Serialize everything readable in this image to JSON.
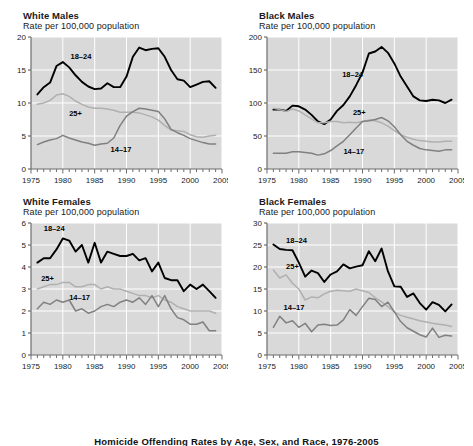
{
  "figure": {
    "caption": "Homicide Offending Rates by Age, Sex, and Race, 1976-2005"
  },
  "colors": {
    "plot_background": "#d9d9d9",
    "gridline": "#ffffff",
    "axis": "#6d6d6d",
    "series_18_24": "#000000",
    "series_25plus": "#b0b0b0",
    "series_14_17": "#808080",
    "text": "#1a1a1a"
  },
  "panels": [
    {
      "title": "White Males",
      "subtitle": "Rate per 100,000 population",
      "labels": {
        "a": "18–24",
        "b": "25+",
        "c": "14–17"
      }
    },
    {
      "title": "Black Males",
      "subtitle": "Rate per 100,000 population",
      "labels": {
        "a": "18–24",
        "b": "25+",
        "c": "14–17"
      }
    },
    {
      "title": "White Females",
      "subtitle": "Rate per 100,000 population",
      "labels": {
        "a": "18–24",
        "b": "25+",
        "c": "14–17"
      }
    },
    {
      "title": "Black Females",
      "subtitle": "Rate per 100,000 population",
      "labels": {
        "a": "18–24",
        "b": "25+",
        "c": "14–17"
      }
    }
  ],
  "chart_data": [
    {
      "type": "line",
      "title": "White Males",
      "subtitle": "Rate per 100,000 population",
      "xlabel": "",
      "ylabel": "Rate per 100,000 population",
      "xlim": [
        1975,
        2005
      ],
      "ylim": [
        0,
        20
      ],
      "yticks": [
        0,
        5,
        10,
        15,
        20
      ],
      "xticks": [
        1975,
        1980,
        1985,
        1990,
        1995,
        2000,
        2005
      ],
      "xtick_minor_step": 1,
      "grid": true,
      "legend": "inline-annotations",
      "x": [
        1976,
        1977,
        1978,
        1979,
        1980,
        1981,
        1982,
        1983,
        1984,
        1985,
        1986,
        1987,
        1988,
        1989,
        1990,
        1991,
        1992,
        1993,
        1994,
        1995,
        1996,
        1997,
        1998,
        1999,
        2000,
        2001,
        2002,
        2003,
        2004
      ],
      "series": [
        {
          "name": "18–24",
          "values": [
            11.3,
            12.4,
            13.1,
            15.6,
            16.2,
            15.4,
            14.2,
            13.2,
            12.5,
            12.1,
            12.2,
            13.0,
            12.4,
            12.4,
            14.0,
            17.0,
            18.4,
            18.0,
            18.2,
            18.3,
            17.0,
            15.0,
            13.6,
            13.4,
            12.4,
            12.8,
            13.2,
            13.3,
            12.3
          ]
        },
        {
          "name": "25+",
          "values": [
            9.8,
            10.0,
            10.4,
            11.2,
            11.4,
            11.0,
            10.3,
            9.8,
            9.4,
            9.2,
            9.2,
            9.1,
            8.9,
            8.6,
            8.6,
            8.6,
            8.5,
            8.2,
            7.9,
            7.4,
            6.6,
            5.9,
            5.8,
            5.7,
            5.2,
            4.9,
            4.8,
            5.0,
            5.1
          ]
        },
        {
          "name": "14–17",
          "values": [
            3.7,
            4.1,
            4.4,
            4.6,
            5.1,
            4.7,
            4.4,
            4.1,
            3.9,
            3.6,
            3.8,
            3.9,
            4.7,
            6.6,
            8.0,
            8.7,
            9.2,
            9.1,
            8.9,
            8.7,
            7.6,
            6.0,
            5.5,
            5.1,
            4.6,
            4.3,
            4.0,
            3.8,
            3.8
          ]
        }
      ]
    },
    {
      "type": "line",
      "title": "Black Males",
      "subtitle": "Rate per 100,000 population",
      "xlabel": "",
      "ylabel": "Rate per 100,000 population",
      "xlim": [
        1975,
        2005
      ],
      "ylim": [
        0,
        200
      ],
      "yticks": [
        0,
        50,
        100,
        150,
        200
      ],
      "xticks": [
        1975,
        1980,
        1985,
        1990,
        1995,
        2000,
        2005
      ],
      "xtick_minor_step": 1,
      "grid": true,
      "legend": "inline-annotations",
      "x": [
        1976,
        1977,
        1978,
        1979,
        1980,
        1981,
        1982,
        1983,
        1984,
        1985,
        1986,
        1987,
        1988,
        1989,
        1990,
        1991,
        1992,
        1993,
        1994,
        1995,
        1996,
        1997,
        1998,
        1999,
        2000,
        2001,
        2002,
        2003,
        2004
      ],
      "series": [
        {
          "name": "18–24",
          "values": [
            90,
            90,
            88,
            96,
            95,
            90,
            82,
            72,
            68,
            75,
            88,
            97,
            110,
            127,
            146,
            175,
            178,
            185,
            176,
            160,
            140,
            125,
            110,
            104,
            103,
            105,
            104,
            100,
            105
          ]
        },
        {
          "name": "25+",
          "values": [
            92,
            90,
            87,
            91,
            88,
            82,
            76,
            70,
            70,
            72,
            72,
            70,
            71,
            70,
            72,
            74,
            73,
            70,
            65,
            58,
            52,
            48,
            45,
            43,
            42,
            41,
            41,
            42,
            42
          ]
        },
        {
          "name": "14–17",
          "values": [
            24,
            24,
            24,
            26,
            26,
            25,
            24,
            21,
            23,
            28,
            35,
            42,
            52,
            62,
            72,
            73,
            75,
            78,
            73,
            64,
            52,
            42,
            36,
            31,
            29,
            28,
            27,
            29,
            29
          ]
        }
      ]
    },
    {
      "type": "line",
      "title": "White Females",
      "subtitle": "Rate per 100,000 population",
      "xlabel": "",
      "ylabel": "Rate per 100,000 population",
      "xlim": [
        1975,
        2005
      ],
      "ylim": [
        0,
        6
      ],
      "yticks": [
        0,
        1,
        2,
        3,
        4,
        5,
        6
      ],
      "xticks": [
        1975,
        1980,
        1985,
        1990,
        1995,
        2000,
        2005
      ],
      "xtick_minor_step": 1,
      "grid": true,
      "legend": "inline-annotations",
      "x": [
        1976,
        1977,
        1978,
        1979,
        1980,
        1981,
        1982,
        1983,
        1984,
        1985,
        1986,
        1987,
        1988,
        1989,
        1990,
        1991,
        1992,
        1993,
        1994,
        1995,
        1996,
        1997,
        1998,
        1999,
        2000,
        2001,
        2002,
        2003,
        2004
      ],
      "series": [
        {
          "name": "18–24",
          "values": [
            4.2,
            4.4,
            4.4,
            4.8,
            5.3,
            5.2,
            4.7,
            5.0,
            4.2,
            5.1,
            4.2,
            4.7,
            4.6,
            4.5,
            4.5,
            4.6,
            4.3,
            4.4,
            3.8,
            4.2,
            3.5,
            3.4,
            3.4,
            2.9,
            3.2,
            3.0,
            3.2,
            2.9,
            2.6
          ]
        },
        {
          "name": "25+",
          "values": [
            3.0,
            3.1,
            3.2,
            3.2,
            3.3,
            3.3,
            3.1,
            3.1,
            3.2,
            3.2,
            3.0,
            3.1,
            3.0,
            3.0,
            2.9,
            2.8,
            2.7,
            2.7,
            2.6,
            2.7,
            2.5,
            2.4,
            2.2,
            2.1,
            2.0,
            2.0,
            2.0,
            2.0,
            1.9
          ]
        },
        {
          "name": "14–17",
          "values": [
            2.1,
            2.4,
            2.3,
            2.5,
            2.4,
            2.5,
            2.0,
            2.1,
            1.9,
            2.0,
            2.2,
            2.3,
            2.2,
            2.4,
            2.5,
            2.4,
            2.6,
            2.3,
            2.7,
            2.2,
            2.7,
            2.1,
            1.7,
            1.6,
            1.4,
            1.4,
            1.5,
            1.1,
            1.1
          ]
        }
      ]
    },
    {
      "type": "line",
      "title": "Black Females",
      "subtitle": "Rate per 100,000 population",
      "xlabel": "",
      "ylabel": "Rate per 100,000 population",
      "xlim": [
        1975,
        2005
      ],
      "ylim": [
        0,
        30
      ],
      "yticks": [
        0,
        5,
        10,
        15,
        20,
        25,
        30
      ],
      "xticks": [
        1975,
        1980,
        1985,
        1990,
        1995,
        2000,
        2005
      ],
      "xtick_minor_step": 1,
      "grid": true,
      "legend": "inline-annotations",
      "x": [
        1976,
        1977,
        1978,
        1979,
        1980,
        1981,
        1982,
        1983,
        1984,
        1985,
        1986,
        1987,
        1988,
        1989,
        1990,
        1991,
        1992,
        1993,
        1994,
        1995,
        1996,
        1997,
        1998,
        1999,
        2000,
        2001,
        2002,
        2003,
        2004
      ],
      "series": [
        {
          "name": "18–24",
          "values": [
            25.1,
            24.1,
            23.9,
            23.8,
            21.0,
            17.8,
            19.2,
            18.6,
            16.6,
            18.3,
            19.0,
            20.6,
            19.7,
            20.1,
            20.4,
            23.6,
            21.3,
            24.2,
            19.0,
            15.6,
            15.5,
            13.2,
            14.0,
            11.8,
            10.3,
            12.0,
            11.4,
            9.9,
            11.5
          ]
        },
        {
          "name": "25+",
          "values": [
            19.3,
            17.5,
            18.2,
            16.3,
            15.0,
            12.5,
            13.2,
            13.0,
            13.9,
            14.5,
            14.7,
            14.6,
            14.5,
            15.0,
            14.6,
            14.2,
            13.0,
            12.1,
            11.0,
            9.8,
            9.0,
            8.6,
            8.2,
            7.8,
            7.5,
            7.2,
            7.0,
            6.8,
            6.5
          ]
        },
        {
          "name": "14–17",
          "values": [
            6.3,
            8.8,
            7.3,
            7.8,
            6.3,
            7.2,
            5.3,
            6.8,
            7.0,
            6.7,
            6.8,
            8.0,
            10.3,
            9.0,
            11.0,
            12.9,
            12.6,
            11.0,
            12.0,
            9.8,
            7.6,
            6.2,
            5.4,
            4.6,
            4.1,
            6.1,
            4.0,
            4.5,
            4.3
          ]
        }
      ]
    }
  ]
}
